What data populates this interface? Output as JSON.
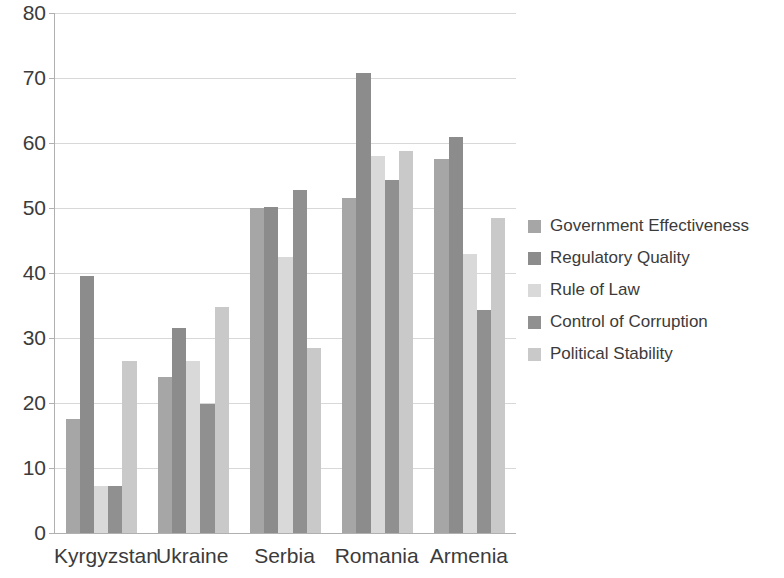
{
  "chart_data": {
    "type": "bar",
    "title": "",
    "subtitle": "",
    "xlabel": "",
    "ylabel": "",
    "ylim": [
      0,
      80
    ],
    "yticks": [
      0,
      10,
      20,
      30,
      40,
      50,
      60,
      70,
      80
    ],
    "ytick_labels": [
      "0",
      "10",
      "20",
      "30",
      "40",
      "50",
      "60",
      "70",
      "80"
    ],
    "grid": true,
    "legend_position": "right",
    "categories": [
      "Kyrgyzstan",
      "Ukraine",
      "Serbia",
      "Romania",
      "Armenia"
    ],
    "series": [
      {
        "name": "Government Effectiveness",
        "color": "#a6a6a6",
        "values": [
          17.5,
          24.0,
          50.0,
          51.5,
          57.5
        ]
      },
      {
        "name": "Regulatory Quality",
        "color": "#8c8c8c",
        "values": [
          39.5,
          31.5,
          50.2,
          70.8,
          61.0
        ]
      },
      {
        "name": "Rule of Law",
        "color": "#d9d9d9",
        "values": [
          7.2,
          26.5,
          42.5,
          58.0,
          43.0
        ]
      },
      {
        "name": "Control of Corruption",
        "color": "#909090",
        "values": [
          7.2,
          19.8,
          52.7,
          54.3,
          34.3
        ]
      },
      {
        "name": "Political Stability",
        "color": "#c9c9c9",
        "values": [
          26.5,
          34.7,
          28.5,
          58.8,
          48.5
        ]
      }
    ]
  }
}
